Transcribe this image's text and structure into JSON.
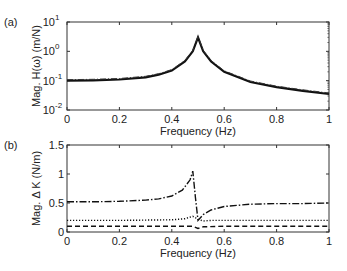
{
  "chart_data": [
    {
      "panel": "(a)",
      "type": "line",
      "title": "",
      "xlabel": "Frequency (Hz)",
      "ylabel": "Mag. H(ω) (m/N)",
      "yscale": "log",
      "xlim": [
        0,
        1
      ],
      "ylim": [
        0.01,
        10
      ],
      "xticks": [
        "0",
        "0.2",
        "0.4",
        "0.6",
        "0.8",
        "1"
      ],
      "yticks": [
        "10^-2",
        "10^-1",
        "10^0",
        "10^1"
      ],
      "grid": false,
      "series": [
        {
          "name": "H(ω) (overlapping responses)",
          "style": "solid/dash-dot overlapping",
          "x": [
            0,
            0.1,
            0.2,
            0.3,
            0.35,
            0.4,
            0.45,
            0.48,
            0.5,
            0.52,
            0.55,
            0.6,
            0.7,
            0.8,
            0.9,
            1.0
          ],
          "y": [
            0.1,
            0.103,
            0.11,
            0.13,
            0.16,
            0.22,
            0.45,
            1.0,
            3.0,
            1.0,
            0.45,
            0.2,
            0.09,
            0.06,
            0.045,
            0.035
          ]
        }
      ]
    },
    {
      "panel": "(b)",
      "type": "line",
      "title": "",
      "xlabel": "Frequency (Hz)",
      "ylabel": "Mag. Δ K (N/m)",
      "xlim": [
        0,
        1
      ],
      "ylim": [
        0,
        1.5
      ],
      "xticks": [
        "0",
        "0.2",
        "0.4",
        "0.6",
        "0.8",
        "1"
      ],
      "yticks": [
        "0",
        "0.5",
        "1",
        "1.5"
      ],
      "grid": false,
      "series": [
        {
          "name": "dash-dot",
          "style": "dashdot",
          "x": [
            0,
            0.1,
            0.2,
            0.3,
            0.35,
            0.4,
            0.44,
            0.47,
            0.48,
            0.49,
            0.5,
            0.52,
            0.55,
            0.6,
            0.7,
            0.8,
            0.9,
            1.0
          ],
          "y": [
            0.52,
            0.52,
            0.53,
            0.55,
            0.57,
            0.62,
            0.72,
            0.9,
            1.05,
            0.6,
            0.2,
            0.3,
            0.38,
            0.44,
            0.48,
            0.49,
            0.49,
            0.5
          ]
        },
        {
          "name": "dotted",
          "style": "dotted",
          "x": [
            0,
            0.2,
            0.4,
            0.45,
            0.48,
            0.5,
            0.52,
            0.55,
            0.6,
            0.8,
            1.0
          ],
          "y": [
            0.2,
            0.2,
            0.21,
            0.23,
            0.27,
            0.22,
            0.19,
            0.2,
            0.2,
            0.2,
            0.2
          ]
        },
        {
          "name": "dashed",
          "style": "dashed",
          "x": [
            0,
            0.2,
            0.4,
            0.48,
            0.5,
            0.52,
            0.6,
            0.8,
            1.0
          ],
          "y": [
            0.1,
            0.1,
            0.1,
            0.1,
            0.06,
            0.09,
            0.1,
            0.1,
            0.1
          ]
        }
      ]
    }
  ]
}
